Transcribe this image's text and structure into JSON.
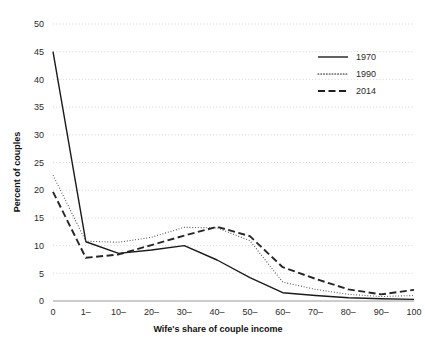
{
  "chart_data": {
    "type": "line",
    "title": "",
    "xlabel": "Wife's share of couple income",
    "ylabel": "Percent of couples",
    "categories": [
      "0",
      "1–",
      "10–",
      "20–",
      "30–",
      "40–",
      "50–",
      "60–",
      "70–",
      "80–",
      "90–",
      "100"
    ],
    "yticks": [
      0,
      5,
      10,
      15,
      20,
      25,
      30,
      35,
      40,
      45,
      50
    ],
    "ylim": [
      0,
      50
    ],
    "grid": true,
    "legend_position": "top-right",
    "series": [
      {
        "name": "1970",
        "style": "solid",
        "color": "#1a1a1a",
        "values": [
          45.0,
          10.7,
          8.6,
          9.2,
          10.0,
          7.4,
          4.2,
          1.5,
          1.0,
          0.6,
          0.4,
          0.3
        ]
      },
      {
        "name": "1990",
        "style": "dotted",
        "color": "#4d4d4d",
        "values": [
          22.7,
          10.8,
          10.6,
          11.5,
          13.3,
          13.2,
          10.9,
          3.4,
          2.1,
          1.2,
          0.8,
          1.0
        ]
      },
      {
        "name": "2014",
        "style": "dashed",
        "color": "#262626",
        "values": [
          19.7,
          7.8,
          8.4,
          10.1,
          11.8,
          13.4,
          11.7,
          6.1,
          4.0,
          2.1,
          1.2,
          2.0
        ]
      }
    ]
  },
  "axes": {
    "y_tick_labels": [
      "0",
      "5",
      "10",
      "15",
      "20",
      "25",
      "30",
      "35",
      "40",
      "45",
      "50"
    ],
    "x_tick_labels": [
      "0",
      "1–",
      "10–",
      "20–",
      "30–",
      "40–",
      "50–",
      "60–",
      "70–",
      "80–",
      "90–",
      "100"
    ],
    "y_title": "Percent of couples",
    "x_title": "Wife's share of couple income"
  },
  "legend": {
    "items": [
      {
        "label": "1970",
        "style": "solid"
      },
      {
        "label": "1990",
        "style": "dotted"
      },
      {
        "label": "2014",
        "style": "dashed"
      }
    ]
  }
}
